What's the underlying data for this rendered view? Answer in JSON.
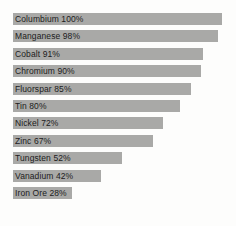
{
  "chart_data": {
    "type": "bar",
    "orientation": "horizontal",
    "title": "",
    "subtitle": "",
    "xlabel": "",
    "ylabel": "",
    "xlim": [
      0,
      100
    ],
    "grid": false,
    "legend": null,
    "value_suffix": "%",
    "categories": [
      "Columbium",
      "Manganese",
      "Cobalt",
      "Chromium",
      "Fluorspar",
      "Tin",
      "Nickel",
      "Zinc",
      "Tungsten",
      "Vanadium",
      "Iron Ore"
    ],
    "values": [
      100,
      98,
      91,
      90,
      85,
      80,
      72,
      67,
      52,
      42,
      28
    ],
    "bars": [
      {
        "label": "Columbium 100%",
        "name": "Columbium",
        "value": 100
      },
      {
        "label": "Manganese 98%",
        "name": "Manganese",
        "value": 98
      },
      {
        "label": "Cobalt 91%",
        "name": "Cobalt",
        "value": 91
      },
      {
        "label": "Chromium 90%",
        "name": "Chromium",
        "value": 90
      },
      {
        "label": "Fluorspar 85%",
        "name": "Fluorspar",
        "value": 85
      },
      {
        "label": "Tin 80%",
        "name": "Tin",
        "value": 80
      },
      {
        "label": "Nickel 72%",
        "name": "Nickel",
        "value": 72
      },
      {
        "label": "Zinc 67%",
        "name": "Zinc",
        "value": 67
      },
      {
        "label": "Tungsten 52%",
        "name": "Tungsten",
        "value": 52
      },
      {
        "label": "Vanadium 42%",
        "name": "Vanadium",
        "value": 42
      },
      {
        "label": "Iron Ore 28%",
        "name": "Iron Ore",
        "value": 28
      }
    ],
    "colors": {
      "background": "#fdfdfc",
      "bar": "#a9a9a7",
      "label_text": "#1c1c1c"
    }
  },
  "layout": {
    "bar_left_px": 13,
    "bar_top_px": 13,
    "bar_height_px": 12,
    "bar_pitch_px": 17.4,
    "full_scale_width_px": 209
  }
}
